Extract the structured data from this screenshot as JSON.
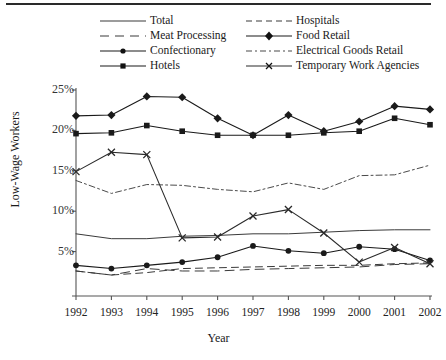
{
  "chart_data": {
    "type": "line",
    "title": "",
    "xlabel": "Year",
    "ylabel": "Low-Wage Workers",
    "categories": [
      "1992",
      "1993",
      "1994",
      "1995",
      "1996",
      "1997",
      "1998",
      "1999",
      "2000",
      "2001",
      "2002"
    ],
    "x": [
      1992,
      1993,
      1994,
      1995,
      1996,
      1997,
      1998,
      1999,
      2000,
      2001,
      2002
    ],
    "ylim": [
      0,
      25
    ],
    "yticks": [
      "0%",
      "5%",
      "10%",
      "15%",
      "20%",
      "25%"
    ],
    "ytick_values": [
      0,
      5,
      10,
      15,
      20,
      25
    ],
    "ytick_suffix": "%",
    "grid": false,
    "legend_position": "top",
    "series": [
      {
        "name": "Total",
        "style": "solid",
        "marker": "none",
        "color": "#3a3a3a",
        "values": [
          7.2,
          6.6,
          6.6,
          6.9,
          7.0,
          7.2,
          7.2,
          7.4,
          7.6,
          7.7,
          7.7
        ]
      },
      {
        "name": "Meat Processing",
        "style": "dashed",
        "marker": "none",
        "color": "#3a3a3a",
        "values": [
          2.6,
          2.1,
          2.9,
          2.6,
          2.6,
          2.8,
          2.9,
          3.0,
          3.1,
          3.4,
          3.5
        ]
      },
      {
        "name": "Confectionary",
        "style": "solid",
        "marker": "circle",
        "color": "#1a1a1a",
        "values": [
          3.3,
          2.9,
          3.3,
          3.7,
          4.3,
          5.7,
          5.1,
          4.8,
          5.6,
          5.3,
          3.9
        ]
      },
      {
        "name": "Hotels",
        "style": "solid",
        "marker": "square",
        "color": "#1a1a1a",
        "values": [
          19.6,
          19.7,
          20.6,
          19.9,
          19.4,
          19.4,
          19.4,
          19.7,
          19.9,
          21.5,
          20.7
        ]
      },
      {
        "name": "Hospitals",
        "style": "dashed-long",
        "marker": "none",
        "color": "#3a3a3a",
        "values": [
          2.6,
          2.1,
          2.4,
          2.9,
          3.0,
          3.1,
          3.2,
          3.3,
          3.3,
          3.5,
          3.6
        ]
      },
      {
        "name": "Food Retail",
        "style": "solid",
        "marker": "diamond",
        "color": "#1a1a1a",
        "values": [
          21.8,
          21.9,
          24.2,
          24.1,
          21.5,
          19.4,
          21.9,
          19.9,
          21.1,
          23.0,
          22.6
        ]
      },
      {
        "name": "Electrical Goods Retail",
        "style": "dashdot",
        "marker": "none",
        "color": "#4a4a4a",
        "values": [
          13.8,
          12.2,
          13.3,
          13.2,
          12.7,
          12.4,
          13.5,
          12.7,
          14.4,
          14.5,
          15.7
        ]
      },
      {
        "name": "Temporary Work Agencies",
        "style": "solid",
        "marker": "cross",
        "color": "#2a2a2a",
        "values": [
          14.9,
          17.3,
          17.0,
          6.7,
          6.8,
          9.4,
          10.2,
          7.3,
          3.7,
          5.5,
          3.5
        ]
      }
    ]
  },
  "legend": {
    "items": [
      {
        "label": "Total"
      },
      {
        "label": "Hospitals"
      },
      {
        "label": "Meat Processing"
      },
      {
        "label": "Food Retail"
      },
      {
        "label": "Confectionary"
      },
      {
        "label": "Electrical Goods Retail"
      },
      {
        "label": "Hotels"
      },
      {
        "label": "Temporary Work Agencies"
      }
    ]
  },
  "axes": {
    "x_title": "Year",
    "y_title": "Low-Wage Workers"
  }
}
